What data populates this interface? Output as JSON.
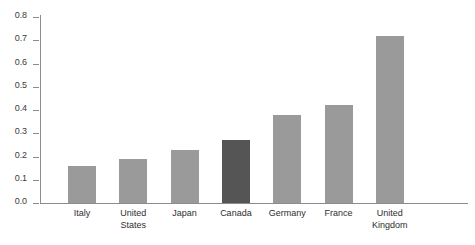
{
  "chart_data": {
    "type": "bar",
    "title": "",
    "subtitle": "",
    "xlabel": "",
    "ylabel": "",
    "categories": [
      "Italy",
      "United States",
      "Japan",
      "Canada",
      "Germany",
      "France",
      "United Kingdom"
    ],
    "values": [
      0.16,
      0.19,
      0.23,
      0.27,
      0.38,
      0.42,
      0.72
    ],
    "ylim": [
      0.0,
      0.8
    ],
    "ytick_labels": [
      "0.0",
      "0.1",
      "0.2",
      "0.3",
      "0.4",
      "0.5",
      "0.6",
      "0.7",
      "0.8"
    ],
    "ytick_values": [
      0.0,
      0.1,
      0.2,
      0.3,
      0.4,
      0.5,
      0.6,
      0.7,
      0.8
    ],
    "grid": false,
    "legend": null,
    "legend_position": "none",
    "highlight_category": "Canada",
    "colors": {
      "bar": "#9a9a9a",
      "bar_highlight": "#555555",
      "axis": "#8c8c8c",
      "text": "#2e2e2e",
      "background": "#ffffff"
    },
    "bars": [
      {
        "label": "Italy",
        "label_lines": "Italy",
        "value": 0.16,
        "highlighted": false
      },
      {
        "label": "United States",
        "label_lines": "United\nStates",
        "value": 0.19,
        "highlighted": false
      },
      {
        "label": "Japan",
        "label_lines": "Japan",
        "value": 0.23,
        "highlighted": false
      },
      {
        "label": "Canada",
        "label_lines": "Canada",
        "value": 0.27,
        "highlighted": true
      },
      {
        "label": "Germany",
        "label_lines": "Germany",
        "value": 0.38,
        "highlighted": false
      },
      {
        "label": "France",
        "label_lines": "France",
        "value": 0.42,
        "highlighted": false
      },
      {
        "label": "United Kingdom",
        "label_lines": "United\nKingdom",
        "value": 0.72,
        "highlighted": false
      }
    ]
  }
}
